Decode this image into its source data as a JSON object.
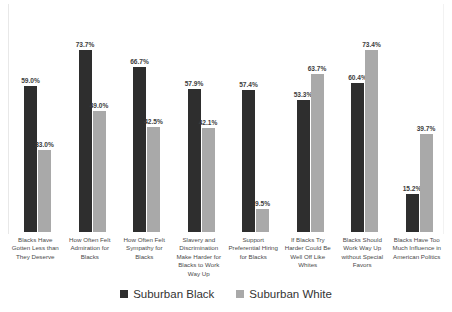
{
  "chart_data": {
    "type": "bar",
    "title": "",
    "subtitle": "",
    "xlabel": "",
    "ylabel": "",
    "ylim": [
      0,
      80
    ],
    "grid": false,
    "legend_position": "bottom",
    "value_suffix": "%",
    "categories": [
      "Blacks Have Gotten Less than They Deserve",
      "How Often Felt Admiration for Blacks",
      "How Often Felt Sympathy for Blacks",
      "Slavery and Discrimination Make Harder for Blacks to Work Way Up",
      "Support Preferential Hiring for Blacks",
      "If Blacks Try Harder Could Be Well Off Like Whites",
      "Blacks Should Work Way Up without Special Favors",
      "Blacks Have Too Much Influence in American Politics"
    ],
    "series": [
      {
        "name": "Suburban Black",
        "color": "#2e2e2e",
        "values": [
          59.0,
          73.7,
          66.7,
          57.9,
          57.4,
          53.3,
          60.4,
          15.2
        ],
        "labels": [
          "59.0%",
          "73.7%",
          "66.7%",
          "57.9%",
          "57.4%",
          "53.3%",
          "60.4%",
          "15.2%"
        ]
      },
      {
        "name": "Suburban White",
        "color": "#a9a9a9",
        "values": [
          33.0,
          49.0,
          42.5,
          42.1,
          9.5,
          63.7,
          73.4,
          39.7
        ],
        "labels": [
          "33.0%",
          "49.0%",
          "42.5%",
          "42.1%",
          "9.5%",
          "63.7%",
          "73.4%",
          "39.7%"
        ]
      }
    ]
  },
  "legend": {
    "items": [
      {
        "label": "Suburban Black",
        "color": "#2e2e2e"
      },
      {
        "label": "Suburban White",
        "color": "#a9a9a9"
      }
    ]
  }
}
